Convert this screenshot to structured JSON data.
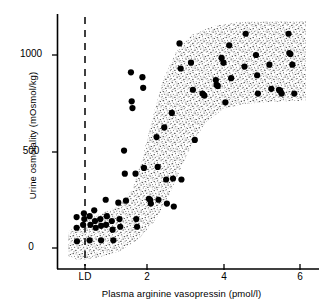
{
  "chart_data": {
    "type": "scatter",
    "title": "",
    "xlabel": "Plasma arginine vasopressin  (pmol/l)",
    "ylabel": "Urine osmolality  (mOsmol/kg)",
    "xlim": [
      -0.3,
      6.6
    ],
    "ylim": [
      -130,
      1190
    ],
    "xticks": [
      0.35,
      2,
      4,
      6
    ],
    "xticklabels": [
      "LD",
      "2",
      "4",
      "6"
    ],
    "yticks": [
      0,
      500,
      1000
    ],
    "yticklabels": [
      "0",
      "500",
      "1000"
    ],
    "grid": false,
    "legend": null,
    "annotations": [
      {
        "name": "limit-of-detection-line",
        "label": "LD",
        "x": 0.35,
        "style": "dashed vertical line",
        "description": "Dashed vertical line marking LD (limit of detection) of plasma arginine vasopressin"
      },
      {
        "name": "stippled-reference-band",
        "label": "",
        "style": "stippled sigmoid band",
        "description": "Stippled (dotted shading) band showing the normal sigmoid relationship between plasma arginine vasopressin and urine osmolality"
      }
    ],
    "series": [
      {
        "name": "Subjects",
        "marker": "filled circle",
        "color": "#000000",
        "points": [
          [
            0.16,
            160
          ],
          [
            0.16,
            105
          ],
          [
            0.17,
            35
          ],
          [
            0.35,
            180
          ],
          [
            0.36,
            150
          ],
          [
            0.33,
            120
          ],
          [
            0.5,
            165
          ],
          [
            0.52,
            120
          ],
          [
            0.5,
            40
          ],
          [
            0.62,
            195
          ],
          [
            0.64,
            140
          ],
          [
            0.66,
            105
          ],
          [
            0.78,
            150
          ],
          [
            0.8,
            115
          ],
          [
            0.8,
            40
          ],
          [
            0.92,
            250
          ],
          [
            0.95,
            165
          ],
          [
            0.93,
            120
          ],
          [
            1.08,
            140
          ],
          [
            1.1,
            95
          ],
          [
            1.12,
            40
          ],
          [
            1.25,
            235
          ],
          [
            1.28,
            150
          ],
          [
            1.3,
            110
          ],
          [
            1.4,
            505
          ],
          [
            1.42,
            385
          ],
          [
            1.45,
            245
          ],
          [
            1.58,
            910
          ],
          [
            1.6,
            760
          ],
          [
            1.62,
            725
          ],
          [
            1.7,
            385
          ],
          [
            1.72,
            150
          ],
          [
            1.74,
            110
          ],
          [
            1.88,
            885
          ],
          [
            1.9,
            830
          ],
          [
            1.92,
            415
          ],
          [
            2.05,
            255
          ],
          [
            2.08,
            250
          ],
          [
            2.1,
            230
          ],
          [
            2.25,
            575
          ],
          [
            2.28,
            420
          ],
          [
            2.3,
            250
          ],
          [
            2.45,
            625
          ],
          [
            2.5,
            355
          ],
          [
            2.52,
            230
          ],
          [
            2.65,
            700
          ],
          [
            2.68,
            360
          ],
          [
            2.7,
            215
          ],
          [
            2.85,
            1060
          ],
          [
            2.88,
            930
          ],
          [
            2.9,
            355
          ],
          [
            3.15,
            960
          ],
          [
            3.2,
            820
          ],
          [
            3.25,
            560
          ],
          [
            3.45,
            800
          ],
          [
            3.5,
            790
          ],
          [
            3.8,
            870
          ],
          [
            3.82,
            845
          ],
          [
            3.85,
            840
          ],
          [
            3.95,
            985
          ],
          [
            4.0,
            960
          ],
          [
            4.05,
            755
          ],
          [
            4.15,
            1050
          ],
          [
            4.2,
            880
          ],
          [
            4.55,
            940
          ],
          [
            4.58,
            1110
          ],
          [
            4.85,
            1000
          ],
          [
            4.88,
            895
          ],
          [
            4.9,
            800
          ],
          [
            5.2,
            950
          ],
          [
            5.25,
            825
          ],
          [
            5.45,
            820
          ],
          [
            5.48,
            815
          ],
          [
            5.52,
            800
          ],
          [
            5.7,
            1110
          ],
          [
            5.72,
            1010
          ],
          [
            5.75,
            1005
          ],
          [
            5.8,
            950
          ],
          [
            5.85,
            800
          ]
        ]
      }
    ]
  },
  "axes": {
    "x_title": "Plasma arginine vasopressin  (pmol/l)",
    "y_title": "Urine osmolality  (mOsmol/kg)",
    "x_tick_labels": [
      "LD",
      "2",
      "4",
      "6"
    ],
    "y_tick_labels": [
      "0",
      "500",
      "1000"
    ]
  },
  "colors": {
    "axis": "#000000",
    "marker": "#000000",
    "band_stipple": "#1a1a1a",
    "background": "#ffffff"
  }
}
